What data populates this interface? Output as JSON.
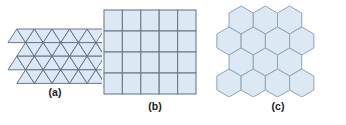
{
  "figure": {
    "background_color": "#ffffff",
    "panels": [
      {
        "id": "a",
        "caption": "(a)",
        "shape_name": "equilateral-triangle",
        "tessellation": "triangular",
        "rows": 4,
        "columns": 5,
        "fill_color": "#dce9f4",
        "stroke_color": "#5a6a82",
        "stroke_width": 0.9
      },
      {
        "id": "b",
        "caption": "(b)",
        "shape_name": "square",
        "tessellation": "square",
        "rows": 4,
        "columns": 5,
        "fill_color": "#dce9f4",
        "stroke_color": "#6b7c90",
        "stroke_width": 1.1
      },
      {
        "id": "c",
        "caption": "(c)",
        "shape_name": "regular-hexagon",
        "tessellation": "hexagonal",
        "rows": 4,
        "columns": 4,
        "fill_color": "#dce9f4",
        "stroke_color": "#8fa3b8",
        "stroke_width": 1.0
      }
    ]
  }
}
